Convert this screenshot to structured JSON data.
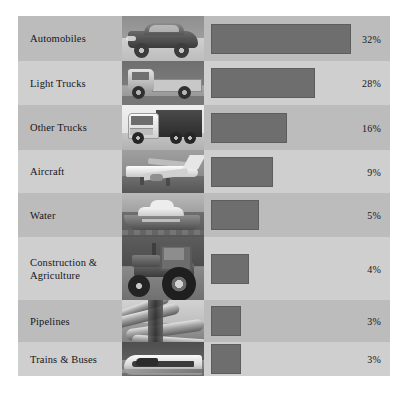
{
  "chart_data": {
    "type": "bar",
    "orientation": "horizontal",
    "title": "",
    "xlabel": "",
    "ylabel": "",
    "categories": [
      "Automobiles",
      "Light Trucks",
      "Other Trucks",
      "Aircraft",
      "Water",
      "Construction & Agriculture",
      "Pipelines",
      "Trains & Buses"
    ],
    "values": [
      32,
      28,
      16,
      9,
      5,
      4,
      3,
      3
    ],
    "value_labels": [
      "32%",
      "28%",
      "16%",
      "9%",
      "5%",
      "4%",
      "3%",
      "3%"
    ],
    "unit": "%",
    "xlim": [
      0,
      32
    ],
    "grid": false,
    "legend": "none"
  },
  "chart": {
    "bar_color": "#6e6e6e",
    "bar_border_color": "#5d5d5d",
    "row_color_dark": "#bcbcbc",
    "row_color_light": "#cfcfcf",
    "text_color": "#16161a",
    "rows": [
      {
        "label": "Automobiles",
        "value_label": "32%",
        "value": 32,
        "bar_width_px": 140,
        "row_height_px": 45,
        "stripe": "dark",
        "thumb_name": "automobile-photo",
        "thumb_class": "t-auto"
      },
      {
        "label": "Light Trucks",
        "value_label": "28%",
        "value": 28,
        "bar_width_px": 104,
        "row_height_px": 44,
        "stripe": "light",
        "thumb_name": "light-truck-photo",
        "thumb_class": "t-lt"
      },
      {
        "label": "Other Trucks",
        "value_label": "16%",
        "value": 16,
        "bar_width_px": 76,
        "row_height_px": 45,
        "stripe": "dark",
        "thumb_name": "other-truck-photo",
        "thumb_class": "t-ot"
      },
      {
        "label": "Aircraft",
        "value_label": "9%",
        "value": 9,
        "bar_width_px": 62,
        "row_height_px": 43,
        "stripe": "light",
        "thumb_name": "aircraft-photo",
        "thumb_class": "t-air"
      },
      {
        "label": "Water",
        "value_label": "5%",
        "value": 5,
        "bar_width_px": 48,
        "row_height_px": 44,
        "stripe": "dark",
        "thumb_name": "water-vessel-photo",
        "thumb_class": "t-wat"
      },
      {
        "label": "Construction & Agriculture",
        "value_label": "4%",
        "value": 4,
        "bar_width_px": 38,
        "row_height_px": 63,
        "stripe": "light",
        "thumb_name": "tractor-photo",
        "thumb_class": "t-con"
      },
      {
        "label": "Pipelines",
        "value_label": "3%",
        "value": 3,
        "bar_width_px": 30,
        "row_height_px": 42,
        "stripe": "dark",
        "thumb_name": "pipeline-photo",
        "thumb_class": "t-pipe"
      },
      {
        "label": "Trains & Buses",
        "value_label": "3%",
        "value": 3,
        "bar_width_px": 30,
        "row_height_px": 34,
        "stripe": "light",
        "thumb_name": "train-photo",
        "thumb_class": "t-train"
      }
    ]
  }
}
